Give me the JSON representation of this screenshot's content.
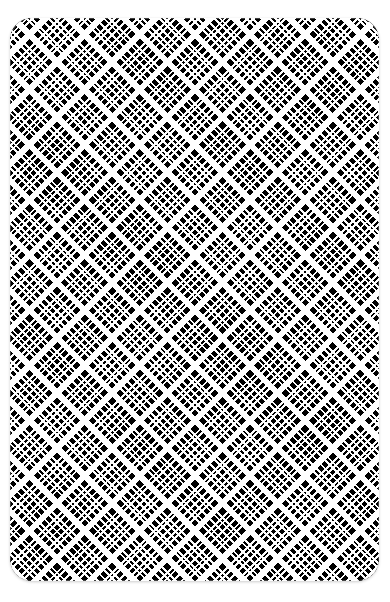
{
  "canvas": {
    "width": 390,
    "height": 602,
    "background_color": "#ffffff"
  },
  "swatch": {
    "name": "swatch-card",
    "left": 10,
    "top": 18,
    "width": 369,
    "height": 563,
    "corner_radius": 22,
    "alt_text": "Black and white diagonal tartan plaid pattern swatch"
  },
  "pattern": {
    "type": "tartan-plaid",
    "orientation_degrees": 45,
    "cross_orientation_degrees": -45,
    "foreground_color": "#ffffff",
    "background_color": "#000000",
    "sett_period_px": 39,
    "threads": [
      {
        "name": "thick-bar",
        "start": 0,
        "end": 6,
        "color": "#ffffff"
      },
      {
        "name": "ground-1",
        "start": 6,
        "end": 12,
        "color": "#000000"
      },
      {
        "name": "thin-pair-a1",
        "start": 12,
        "end": 14,
        "color": "#ffffff"
      },
      {
        "name": "ground-2",
        "start": 14,
        "end": 16,
        "color": "#000000"
      },
      {
        "name": "thin-pair-a2",
        "start": 16,
        "end": 18,
        "color": "#ffffff"
      },
      {
        "name": "ground-3",
        "start": 18,
        "end": 22,
        "color": "#000000"
      },
      {
        "name": "thin-centre",
        "start": 22,
        "end": 24,
        "color": "#ffffff"
      },
      {
        "name": "ground-4",
        "start": 24,
        "end": 28,
        "color": "#000000"
      },
      {
        "name": "thin-pair-b1",
        "start": 28,
        "end": 30,
        "color": "#ffffff"
      },
      {
        "name": "ground-5",
        "start": 30,
        "end": 32,
        "color": "#000000"
      },
      {
        "name": "thin-pair-b2",
        "start": 32,
        "end": 34,
        "color": "#ffffff"
      },
      {
        "name": "ground-6",
        "start": 34,
        "end": 39,
        "color": "#000000"
      }
    ]
  }
}
